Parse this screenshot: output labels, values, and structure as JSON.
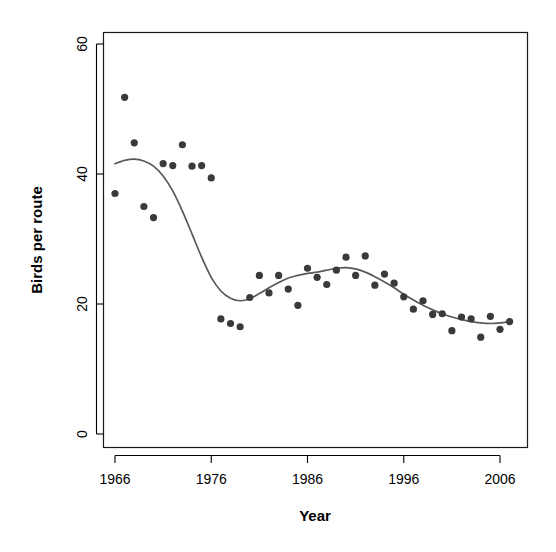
{
  "chart_data": {
    "type": "scatter",
    "title": "",
    "xlabel": "Year",
    "ylabel": "Birds per route",
    "xlim": [
      1964.8,
      2008.0
    ],
    "ylim": [
      -1.5,
      63.0
    ],
    "xticks": [
      1966,
      1976,
      1986,
      1996,
      2006
    ],
    "xtick_labels": [
      "1966",
      "1976",
      "1986",
      "1996",
      "2006"
    ],
    "yticks": [
      0,
      20,
      40,
      60
    ],
    "ytick_labels": [
      "0",
      "20",
      "40",
      "60"
    ],
    "grid": false,
    "legend": "none",
    "point_color": "#3a3a3a",
    "point_size": 7.2,
    "line_color": "#595959",
    "series": [
      {
        "name": "Birds per route",
        "type": "scatter",
        "x": [
          1966,
          1967,
          1968,
          1969,
          1970,
          1971,
          1972,
          1973,
          1974,
          1975,
          1976,
          1977,
          1978,
          1979,
          1980,
          1981,
          1982,
          1983,
          1984,
          1985,
          1986,
          1987,
          1988,
          1989,
          1990,
          1991,
          1992,
          1993,
          1994,
          1995,
          1996,
          1997,
          1998,
          1999,
          2000,
          2001,
          2002,
          2003,
          2004,
          2005,
          2006,
          2007
        ],
        "y": [
          37.0,
          51.8,
          44.8,
          35.0,
          33.3,
          41.6,
          41.3,
          44.5,
          41.2,
          41.3,
          39.4,
          17.7,
          17.0,
          16.5,
          21.0,
          24.4,
          21.7,
          24.4,
          22.3,
          19.8,
          25.5,
          24.1,
          23.0,
          25.2,
          27.2,
          24.4,
          27.4,
          22.9,
          24.6,
          23.2,
          21.1,
          19.2,
          20.5,
          18.4,
          18.5,
          15.9,
          18.0,
          17.7,
          14.9,
          18.1,
          16.1,
          17.3
        ]
      },
      {
        "name": "loess smooth",
        "type": "line",
        "x": [
          1966.0,
          1967.0,
          1968.0,
          1969.0,
          1970.0,
          1971.0,
          1972.0,
          1973.0,
          1974.0,
          1975.0,
          1976.0,
          1977.0,
          1978.0,
          1979.0,
          1980.0,
          1981.0,
          1982.0,
          1983.0,
          1984.0,
          1985.0,
          1986.0,
          1987.0,
          1988.0,
          1989.0,
          1990.0,
          1991.0,
          1992.0,
          1993.0,
          1994.0,
          1995.0,
          1996.0,
          1997.0,
          1998.0,
          1999.0,
          2000.0,
          2001.0,
          2002.0,
          2003.0,
          2004.0,
          2005.0,
          2006.0,
          2007.0
        ],
        "y": [
          41.6,
          42.1,
          42.3,
          42.0,
          41.2,
          39.7,
          37.4,
          34.3,
          30.8,
          27.2,
          24.1,
          22.0,
          20.9,
          20.5,
          20.8,
          21.6,
          22.5,
          23.3,
          24.0,
          24.4,
          24.7,
          24.9,
          25.2,
          25.5,
          25.6,
          25.4,
          24.9,
          24.2,
          23.4,
          22.5,
          21.5,
          20.6,
          19.8,
          19.1,
          18.5,
          18.0,
          17.6,
          17.3,
          17.1,
          17.0,
          17.1,
          17.3
        ]
      }
    ]
  },
  "axes": {
    "x_title": "Year",
    "y_title": "Birds per route"
  }
}
